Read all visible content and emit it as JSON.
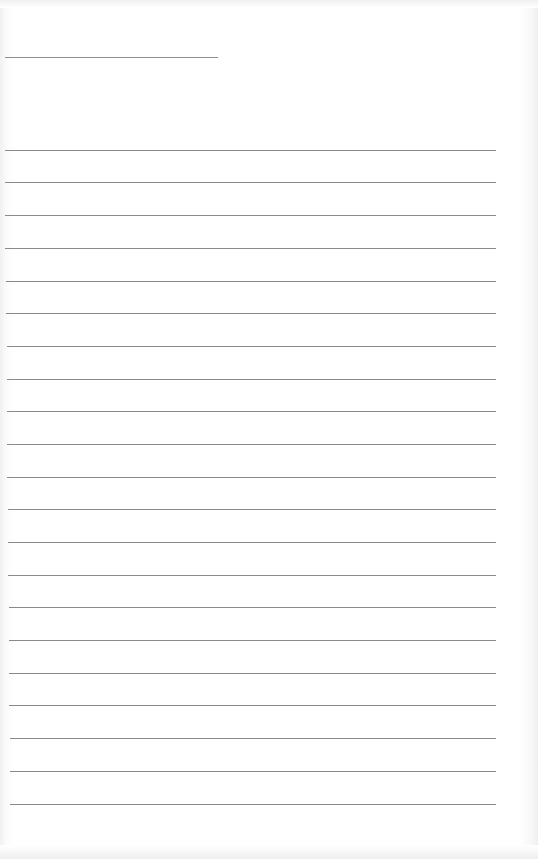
{
  "document": {
    "type": "blank ruled sheet",
    "header_line": {
      "x_start": 5,
      "x_end": 218,
      "y": 57
    },
    "ruled_lines": [
      {
        "y": 150,
        "x_start": 5,
        "x_end": 496
      },
      {
        "y": 182,
        "x_start": 5,
        "x_end": 496
      },
      {
        "y": 215,
        "x_start": 5,
        "x_end": 496
      },
      {
        "y": 248,
        "x_start": 5,
        "x_end": 496
      },
      {
        "y": 281,
        "x_start": 6,
        "x_end": 496
      },
      {
        "y": 313,
        "x_start": 6,
        "x_end": 496
      },
      {
        "y": 346,
        "x_start": 7,
        "x_end": 496
      },
      {
        "y": 379,
        "x_start": 7,
        "x_end": 496
      },
      {
        "y": 411,
        "x_start": 7,
        "x_end": 496
      },
      {
        "y": 444,
        "x_start": 7,
        "x_end": 496
      },
      {
        "y": 477,
        "x_start": 7,
        "x_end": 496
      },
      {
        "y": 509,
        "x_start": 8,
        "x_end": 496
      },
      {
        "y": 542,
        "x_start": 8,
        "x_end": 496
      },
      {
        "y": 575,
        "x_start": 8,
        "x_end": 496
      },
      {
        "y": 607,
        "x_start": 9,
        "x_end": 496
      },
      {
        "y": 640,
        "x_start": 9,
        "x_end": 496
      },
      {
        "y": 673,
        "x_start": 9,
        "x_end": 496
      },
      {
        "y": 705,
        "x_start": 9,
        "x_end": 496
      },
      {
        "y": 738,
        "x_start": 10,
        "x_end": 496
      },
      {
        "y": 771,
        "x_start": 10,
        "x_end": 496
      },
      {
        "y": 804,
        "x_start": 10,
        "x_end": 496
      }
    ],
    "line_color": "#8a8a8a",
    "paper_color": "#ffffff"
  }
}
